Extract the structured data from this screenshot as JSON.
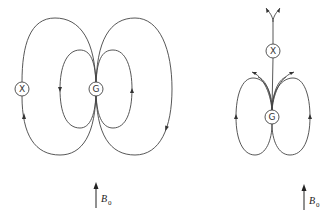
{
  "diagram": {
    "left": {
      "nodes": [
        {
          "id": "X",
          "label": "X",
          "cx": 22,
          "cy": 89
        },
        {
          "id": "G",
          "label": "G",
          "cx": 96,
          "cy": 89
        }
      ],
      "field_label": {
        "symbol": "B",
        "subscript": "0"
      }
    },
    "right": {
      "nodes": [
        {
          "id": "X",
          "label": "X",
          "cx": 273,
          "cy": 51
        },
        {
          "id": "G",
          "label": "G",
          "cx": 272,
          "cy": 117
        }
      ],
      "field_label": {
        "symbol": "B",
        "subscript": "0"
      }
    },
    "colors": {
      "stroke": "#444444",
      "background": "#ffffff"
    }
  }
}
